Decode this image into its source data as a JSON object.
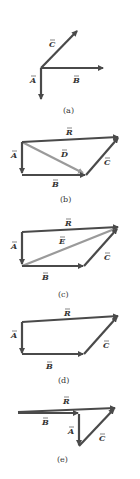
{
  "colors": {
    "vector": "#4a4a4a",
    "resultant_light": "#9a9a9a",
    "text": "#333333"
  },
  "panels": [
    {
      "id": "a",
      "caption": "(a)",
      "labels": {
        "C": "C",
        "A": "A",
        "B": "B"
      }
    },
    {
      "id": "b",
      "caption": "(b)",
      "labels": {
        "R": "R",
        "A": "A",
        "D": "D",
        "C": "C",
        "B": "B"
      }
    },
    {
      "id": "c",
      "caption": "(c)",
      "labels": {
        "R": "R",
        "A": "A",
        "E": "E",
        "C": "C",
        "B": "B"
      }
    },
    {
      "id": "d",
      "caption": "(d)",
      "labels": {
        "R": "R",
        "A": "A",
        "C": "C",
        "B": "B"
      }
    },
    {
      "id": "e",
      "caption": "(e)",
      "labels": {
        "R": "R",
        "B": "B",
        "A": "A",
        "C": "C"
      }
    }
  ]
}
